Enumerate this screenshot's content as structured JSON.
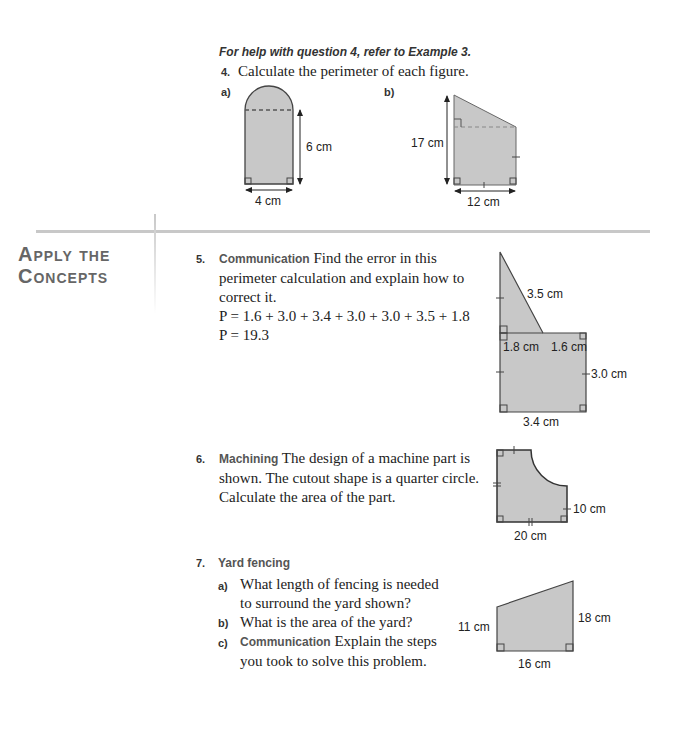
{
  "help_note": "For help with question 4, refer to Example 3.",
  "q4": {
    "number": "4.",
    "text": "Calculate the perimeter of each figure.",
    "a": {
      "label": "a)",
      "height": "6 cm",
      "width": "4 cm"
    },
    "b": {
      "label": "b)",
      "height": "17 cm",
      "width": "12 cm"
    }
  },
  "section": {
    "line1": "Apply the",
    "line2": "Concepts"
  },
  "q5": {
    "number": "5.",
    "tag": "Communication",
    "text_line1": " Find the error in this",
    "text_line2": "perimeter calculation and explain how to",
    "text_line3": "correct it.",
    "eq1": "P = 1.6 + 3.0 + 3.4 + 3.0 + 3.0 + 3.5 + 1.8",
    "eq2": "P = 19.3",
    "figure": {
      "hyp": "3.5 cm",
      "left_top": "1.8 cm",
      "right_top": "1.6 cm",
      "right": "3.0 cm",
      "bottom": "3.4 cm"
    }
  },
  "q6": {
    "number": "6.",
    "tag": "Machining",
    "text_line1": " The design of a machine part is",
    "text_line2": "shown. The cutout shape is a quarter circle.",
    "text_line3": "Calculate the area of the part.",
    "figure": {
      "right": "10 cm",
      "bottom": "20 cm"
    }
  },
  "q7": {
    "number": "7.",
    "tag": "Yard fencing",
    "a": {
      "label": "a)",
      "line1": "What length of fencing is needed",
      "line2": "to surround the yard shown?"
    },
    "b": {
      "label": "b)",
      "line1": "What is the area of the yard?"
    },
    "c": {
      "label": "c)",
      "tag": "Communication",
      "line1": " Explain the steps",
      "line2": "you took to solve this problem."
    },
    "figure": {
      "left": "11 cm",
      "right": "18 cm",
      "bottom": "16 cm"
    }
  },
  "colors": {
    "fill": "#c8c8c8",
    "stroke": "#444444",
    "header": "#666666",
    "rule": "#c8c8c8"
  }
}
